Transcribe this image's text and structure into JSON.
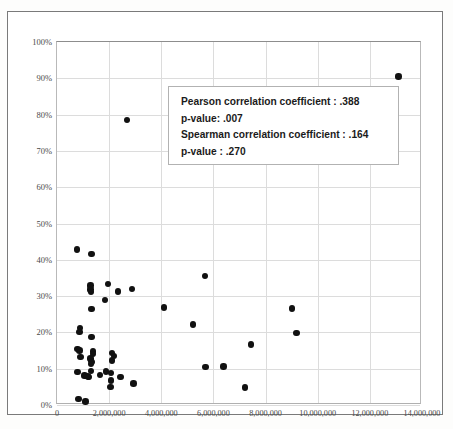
{
  "chart_data": {
    "type": "scatter",
    "title": "",
    "xlabel": "",
    "ylabel": "",
    "xlim": [
      0,
      14000000
    ],
    "ylim": [
      0,
      1.0
    ],
    "grid": true,
    "legend": null,
    "x_tick_labels": [
      "0",
      "2,000,000",
      "4,000,000",
      "6,000,000",
      "8,000,000",
      "10,000,000",
      "12,000,000",
      "14,000,000"
    ],
    "x_tick_values": [
      0,
      2000000,
      4000000,
      6000000,
      8000000,
      10000000,
      12000000,
      14000000
    ],
    "y_tick_labels": [
      "0%",
      "10%",
      "20%",
      "30%",
      "40%",
      "50%",
      "60%",
      "70%",
      "80%",
      "90%",
      "100%"
    ],
    "y_tick_values": [
      0,
      0.1,
      0.2,
      0.3,
      0.4,
      0.5,
      0.6,
      0.7,
      0.8,
      0.9,
      1.0
    ],
    "series": [
      {
        "name": "observations",
        "marker": "circle",
        "color": "#111111",
        "points": [
          [
            13100000,
            0.905
          ],
          [
            2680000,
            0.785
          ],
          [
            770000,
            0.428
          ],
          [
            1320000,
            0.416
          ],
          [
            5680000,
            0.355
          ],
          [
            1290000,
            0.329
          ],
          [
            1950000,
            0.334
          ],
          [
            1290000,
            0.318
          ],
          [
            1300000,
            0.312
          ],
          [
            2340000,
            0.313
          ],
          [
            2870000,
            0.32
          ],
          [
            1840000,
            0.29
          ],
          [
            4100000,
            0.269
          ],
          [
            9020000,
            0.266
          ],
          [
            1330000,
            0.264
          ],
          [
            5210000,
            0.222
          ],
          [
            880000,
            0.212
          ],
          [
            870000,
            0.201
          ],
          [
            9190000,
            0.198
          ],
          [
            1330000,
            0.188
          ],
          [
            7450000,
            0.167
          ],
          [
            780000,
            0.155
          ],
          [
            870000,
            0.15
          ],
          [
            1380000,
            0.147
          ],
          [
            1390000,
            0.141
          ],
          [
            2120000,
            0.143
          ],
          [
            2180000,
            0.135
          ],
          [
            900000,
            0.133
          ],
          [
            1290000,
            0.128
          ],
          [
            1300000,
            0.122
          ],
          [
            2120000,
            0.123
          ],
          [
            1340000,
            0.118
          ],
          [
            1310000,
            0.113
          ],
          [
            5700000,
            0.104
          ],
          [
            6380000,
            0.106
          ],
          [
            780000,
            0.091
          ],
          [
            1300000,
            0.093
          ],
          [
            1880000,
            0.092
          ],
          [
            2080000,
            0.089
          ],
          [
            1050000,
            0.081
          ],
          [
            1120000,
            0.08
          ],
          [
            1180000,
            0.079
          ],
          [
            1230000,
            0.077
          ],
          [
            1640000,
            0.082
          ],
          [
            2440000,
            0.077
          ],
          [
            2060000,
            0.067
          ],
          [
            2930000,
            0.059
          ],
          [
            2050000,
            0.049
          ],
          [
            7200000,
            0.048
          ],
          [
            820000,
            0.016
          ],
          [
            1100000,
            0.01
          ]
        ]
      }
    ],
    "annotation_box": {
      "lines": [
        "Pearson correlation coefficient :  .388",
        "p-value: .007",
        "Spearman correlation coefficient : .164",
        "p-value :  .270"
      ],
      "pearson_correlation_coefficient": ".388",
      "pearson_p_value": ".007",
      "spearman_correlation_coefficient": ".164",
      "spearman_p_value": ".270"
    }
  }
}
